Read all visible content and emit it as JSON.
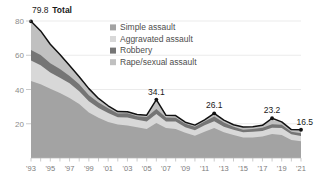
{
  "chart_data": {
    "type": "area",
    "stacked": true,
    "title": "",
    "subtitle": "",
    "xlabel": "",
    "ylabel": "",
    "xlim": [
      1993,
      2021
    ],
    "ylim": [
      0,
      80
    ],
    "yticks": [
      20,
      40,
      60,
      80
    ],
    "ytick_labels": [
      "20",
      "40",
      "60",
      "80"
    ],
    "grid": true,
    "legend_position": "inside-top-right",
    "x": [
      1993,
      1994,
      1995,
      1996,
      1997,
      1998,
      1999,
      2000,
      2001,
      2002,
      2003,
      2004,
      2005,
      2006,
      2007,
      2008,
      2009,
      2010,
      2011,
      2012,
      2013,
      2014,
      2015,
      2016,
      2017,
      2018,
      2019,
      2020,
      2021
    ],
    "xtick_labels": [
      "'93",
      "'95",
      "'97",
      "'99",
      "'01",
      "'03",
      "'05",
      "'07",
      "'09",
      "'11",
      "'13",
      "'15",
      "'17",
      "'19",
      "'21"
    ],
    "xtick_values": [
      1993,
      1995,
      1997,
      1999,
      2001,
      2003,
      2005,
      2007,
      2009,
      2011,
      2013,
      2015,
      2017,
      2019,
      2021
    ],
    "series": [
      {
        "name": "Simple assault",
        "color": "#a3a3a3",
        "values": [
          45.0,
          43.0,
          40.5,
          38.0,
          35.0,
          31.5,
          26.5,
          23.5,
          21.0,
          19.5,
          19.0,
          18.0,
          17.0,
          20.5,
          17.5,
          17.0,
          14.8,
          13.0,
          15.3,
          17.5,
          15.0,
          13.5,
          12.0,
          12.0,
          12.5,
          14.0,
          13.5,
          10.5,
          9.8
        ]
      },
      {
        "name": "Aggravated assault",
        "color": "#d8d8d8",
        "values": [
          12.0,
          11.2,
          9.5,
          8.8,
          8.6,
          7.5,
          6.7,
          5.7,
          5.3,
          4.3,
          4.6,
          4.3,
          4.3,
          5.2,
          3.8,
          4.3,
          3.2,
          3.2,
          3.8,
          4.0,
          3.3,
          3.0,
          3.0,
          3.3,
          3.2,
          3.7,
          4.0,
          3.3,
          3.1
        ]
      },
      {
        "name": "Robbery",
        "color": "#757575",
        "values": [
          6.0,
          6.0,
          5.4,
          5.2,
          4.3,
          4.0,
          3.5,
          3.2,
          2.8,
          2.2,
          2.5,
          2.1,
          2.6,
          2.9,
          2.4,
          2.2,
          2.0,
          2.0,
          2.2,
          2.8,
          2.4,
          1.8,
          1.5,
          1.7,
          2.0,
          2.0,
          1.9,
          1.6,
          1.6
        ]
      },
      {
        "name": "Rape/sexual assault",
        "color": "#c0c0c0",
        "values": [
          16.8,
          14.0,
          11.0,
          8.5,
          6.1,
          4.5,
          3.8,
          2.4,
          1.4,
          1.1,
          0.9,
          1.0,
          1.1,
          5.5,
          1.2,
          1.3,
          0.9,
          1.0,
          1.0,
          1.8,
          1.4,
          1.1,
          1.6,
          1.2,
          1.4,
          2.7,
          1.7,
          1.2,
          2.0
        ]
      }
    ],
    "total_line": {
      "name": "Total",
      "color": "#111111",
      "values": [
        79.8,
        74.2,
        66.4,
        60.5,
        54.0,
        47.5,
        40.5,
        34.8,
        30.5,
        27.1,
        27.0,
        25.4,
        25.0,
        34.1,
        24.9,
        24.8,
        20.9,
        19.2,
        22.3,
        26.1,
        22.1,
        19.4,
        18.1,
        18.2,
        19.1,
        23.2,
        21.1,
        16.6,
        16.5
      ]
    },
    "annotations": [
      {
        "label": "79.8",
        "bold_suffix": "Total",
        "x": 1993,
        "y": 79.8
      },
      {
        "label": "34.1",
        "x": 2006,
        "y": 34.1
      },
      {
        "label": "26.1",
        "x": 2012,
        "y": 26.1
      },
      {
        "label": "23.2",
        "x": 2018,
        "y": 23.2
      },
      {
        "label": "16.5",
        "x": 2021,
        "y": 16.5
      }
    ]
  },
  "legend": {
    "items": [
      {
        "label": "Simple assault",
        "color": "#a3a3a3"
      },
      {
        "label": "Aggravated assault",
        "color": "#d8d8d8"
      },
      {
        "label": "Robbery",
        "color": "#757575"
      },
      {
        "label": "Rape/sexual assault",
        "color": "#c0c0c0"
      }
    ]
  },
  "axis": {
    "y_labels": [
      "80",
      "60",
      "40",
      "20"
    ],
    "x_labels": [
      "'93",
      "'95",
      "'97",
      "'99",
      "'01",
      "'03",
      "'05",
      "'07",
      "'09",
      "'11",
      "'13",
      "'15",
      "'17",
      "'19",
      "'21"
    ]
  },
  "callouts": {
    "start_value": "79.8",
    "start_word": "Total",
    "peak_2006": "34.1",
    "peak_2012": "26.1",
    "peak_2018": "23.2",
    "end_2021": "16.5"
  }
}
